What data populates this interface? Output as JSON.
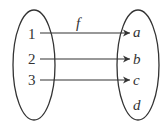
{
  "diagram": {
    "type": "function-mapping",
    "function_label": "f",
    "domain_set": {
      "elements": [
        "1",
        "2",
        "3"
      ]
    },
    "codomain_set": {
      "elements": [
        "a",
        "b",
        "c",
        "d"
      ]
    },
    "mappings": [
      {
        "from": "1",
        "to": "a"
      },
      {
        "from": "2",
        "to": "b"
      },
      {
        "from": "3",
        "to": "c"
      }
    ],
    "colors": {
      "stroke": "#333333",
      "background": "#ffffff"
    }
  }
}
